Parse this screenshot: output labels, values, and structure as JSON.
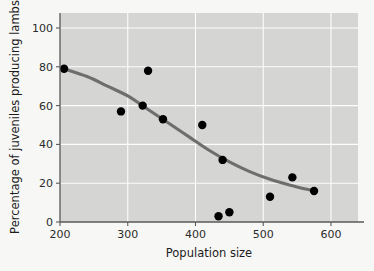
{
  "chart_data": {
    "type": "scatter",
    "title": "",
    "subtitle": "",
    "xlabel": "Population size",
    "ylabel": "Percentage of juveniles producing lambs",
    "xlim": [
      200,
      635
    ],
    "ylim": [
      0,
      108
    ],
    "xticks": [
      200,
      300,
      400,
      500,
      600
    ],
    "yticks": [
      0,
      20,
      40,
      60,
      80,
      100
    ],
    "xtick_labels": [
      "200",
      "300",
      "400",
      "500",
      "600"
    ],
    "ytick_labels": [
      "0",
      "20",
      "40",
      "60",
      "80",
      "100"
    ],
    "grid": true,
    "legend": false,
    "legend_position": "none",
    "points": [
      {
        "x": 206,
        "y": 79
      },
      {
        "x": 290,
        "y": 57
      },
      {
        "x": 322,
        "y": 60
      },
      {
        "x": 330,
        "y": 78
      },
      {
        "x": 352,
        "y": 53
      },
      {
        "x": 410,
        "y": 50
      },
      {
        "x": 434,
        "y": 3
      },
      {
        "x": 440,
        "y": 32
      },
      {
        "x": 450,
        "y": 5
      },
      {
        "x": 510,
        "y": 13
      },
      {
        "x": 543,
        "y": 23
      },
      {
        "x": 575,
        "y": 16
      }
    ],
    "fit_curve": {
      "label": "fitted trend line",
      "points": [
        {
          "x": 206,
          "y": 79
        },
        {
          "x": 240,
          "y": 75
        },
        {
          "x": 270,
          "y": 70
        },
        {
          "x": 300,
          "y": 65
        },
        {
          "x": 330,
          "y": 58
        },
        {
          "x": 360,
          "y": 51
        },
        {
          "x": 390,
          "y": 44
        },
        {
          "x": 420,
          "y": 37
        },
        {
          "x": 450,
          "y": 31
        },
        {
          "x": 480,
          "y": 26
        },
        {
          "x": 510,
          "y": 22
        },
        {
          "x": 540,
          "y": 19
        },
        {
          "x": 575,
          "y": 16
        }
      ]
    },
    "colors": {
      "plot_background": "#d5d5d4",
      "figure_background": "#f7f7f5",
      "gridline": "#fdfdfd",
      "point": "#000000",
      "curve": "#6e6e6e",
      "axis": "#5a5a5a",
      "text": "#1c1c1c"
    },
    "marker_size": 4.2
  }
}
